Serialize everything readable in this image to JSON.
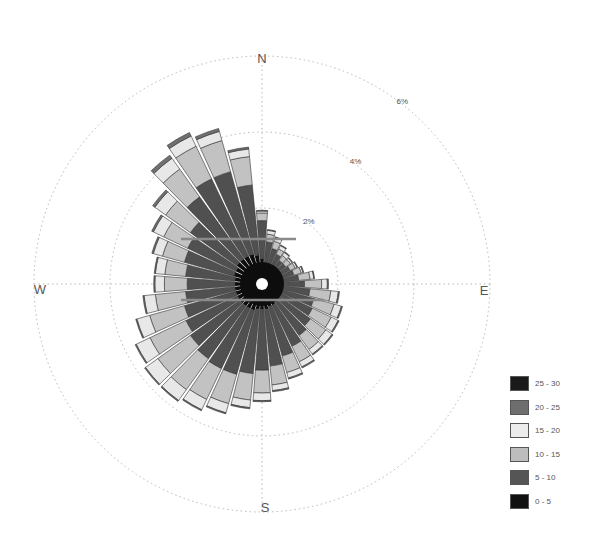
{
  "chart_data": {
    "type": "windrose",
    "title": "",
    "center": [
      262,
      284
    ],
    "compass": {
      "N": "N",
      "E": "E",
      "S": "S",
      "W": "W"
    },
    "rings": [
      {
        "value": 2,
        "label": "2%",
        "radius": 76
      },
      {
        "value": 4,
        "label": "4%",
        "radius": 152
      },
      {
        "value": 6,
        "label": "6%",
        "radius": 228
      }
    ],
    "bins": [
      "0 - 5",
      "5 - 10",
      "10 - 15",
      "15 - 20",
      "20 - 25",
      "25 - 30"
    ],
    "bin_colors": [
      "#111111",
      "#4a4a4a",
      "#bdbdbd",
      "#e6e6e6",
      "#6e6e6e",
      "#1e1e1e"
    ],
    "directions_deg": [
      0,
      10,
      20,
      30,
      40,
      50,
      60,
      70,
      80,
      90,
      100,
      110,
      120,
      130,
      140,
      150,
      160,
      170,
      180,
      190,
      200,
      210,
      220,
      230,
      240,
      250,
      260,
      270,
      280,
      290,
      300,
      310,
      320,
      330,
      340,
      350
    ],
    "series": [
      {
        "name": "0 - 5",
        "values": [
          0.55,
          0.45,
          0.4,
          0.35,
          0.3,
          0.3,
          0.3,
          0.3,
          0.3,
          0.3,
          0.3,
          0.35,
          0.35,
          0.4,
          0.45,
          0.5,
          0.5,
          0.55,
          0.55,
          0.55,
          0.6,
          0.6,
          0.6,
          0.6,
          0.6,
          0.6,
          0.6,
          0.6,
          0.6,
          0.65,
          0.65,
          0.7,
          0.7,
          0.7,
          0.7,
          0.65
        ]
      },
      {
        "name": "5 - 10",
        "values": [
          1.0,
          0.55,
          0.45,
          0.4,
          0.35,
          0.35,
          0.4,
          0.45,
          0.55,
          0.7,
          0.85,
          0.95,
          1.0,
          1.05,
          1.1,
          1.2,
          1.35,
          1.5,
          1.6,
          1.7,
          1.75,
          1.75,
          1.7,
          1.6,
          1.5,
          1.4,
          1.3,
          1.25,
          1.3,
          1.35,
          1.4,
          1.5,
          2.0,
          2.25,
          2.25,
          1.85
        ]
      },
      {
        "name": "10 - 15",
        "values": [
          0.2,
          0.2,
          0.2,
          0.15,
          0.15,
          0.15,
          0.15,
          0.2,
          0.3,
          0.45,
          0.55,
          0.55,
          0.55,
          0.5,
          0.45,
          0.45,
          0.45,
          0.5,
          0.6,
          0.7,
          0.8,
          0.9,
          1.0,
          1.05,
          1.05,
          0.95,
          0.8,
          0.6,
          0.55,
          0.6,
          0.7,
          0.8,
          0.9,
          0.95,
          0.85,
          0.75
        ]
      },
      {
        "name": "15 - 20",
        "values": [
          0.05,
          0.1,
          0.1,
          0.1,
          0.1,
          0.05,
          0.05,
          0.05,
          0.1,
          0.15,
          0.2,
          0.2,
          0.2,
          0.2,
          0.15,
          0.15,
          0.15,
          0.15,
          0.2,
          0.2,
          0.25,
          0.3,
          0.35,
          0.4,
          0.4,
          0.35,
          0.3,
          0.25,
          0.25,
          0.25,
          0.3,
          0.35,
          0.35,
          0.3,
          0.25,
          0.2
        ]
      },
      {
        "name": "20 - 25",
        "values": [
          0.02,
          0.02,
          0.02,
          0.02,
          0.02,
          0.02,
          0.02,
          0.02,
          0.02,
          0.03,
          0.03,
          0.03,
          0.03,
          0.03,
          0.03,
          0.03,
          0.03,
          0.03,
          0.03,
          0.03,
          0.03,
          0.03,
          0.03,
          0.03,
          0.03,
          0.03,
          0.03,
          0.03,
          0.03,
          0.04,
          0.05,
          0.07,
          0.1,
          0.1,
          0.08,
          0.05
        ]
      },
      {
        "name": "25 - 30",
        "values": [
          0,
          0,
          0,
          0,
          0,
          0,
          0,
          0,
          0,
          0,
          0,
          0,
          0,
          0,
          0,
          0,
          0,
          0,
          0,
          0,
          0,
          0,
          0,
          0,
          0,
          0,
          0,
          0,
          0,
          0,
          0,
          0,
          0,
          0,
          0,
          0
        ]
      }
    ],
    "legend_position": "bottom-right",
    "grid": true
  },
  "legend": {
    "items": [
      {
        "label": "25 - 30",
        "color": "#1a1a1a"
      },
      {
        "label": "20 - 25",
        "color": "#6e6e6e"
      },
      {
        "label": "15 - 20",
        "color": "#ececec"
      },
      {
        "label": "10 - 15",
        "color": "#bdbdbd"
      },
      {
        "label": "5 - 10",
        "color": "#555555"
      },
      {
        "label": "0 - 5",
        "color": "#111111"
      }
    ]
  }
}
